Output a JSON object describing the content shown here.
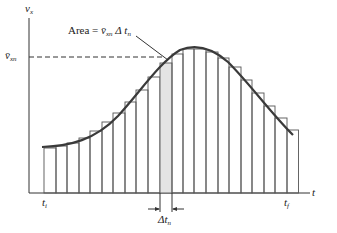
{
  "diagram": {
    "y_axis_label": "v",
    "y_axis_label_sub": "x",
    "x_axis_label": "t",
    "avg_velocity_label": "v̄",
    "avg_velocity_label_sub": "xn",
    "area_label_prefix": "Area = ",
    "area_label_v": "v̄",
    "area_label_v_sub": "xn",
    "area_label_dt": " Δ t",
    "area_label_dt_sub": "n",
    "t_initial": "t",
    "t_initial_sub": "i",
    "t_final": "t",
    "t_final_sub": "f",
    "delta_t": "Δt",
    "delta_t_sub": "n",
    "colors": {
      "line": "#3a3a3a",
      "shaded": "#e4e4e4",
      "background": "#ffffff"
    },
    "baseline_y": 193,
    "bars": [
      {
        "x": 44,
        "top": 148
      },
      {
        "x": 56,
        "top": 146
      },
      {
        "x": 67,
        "top": 143
      },
      {
        "x": 79,
        "top": 138
      },
      {
        "x": 90,
        "top": 131
      },
      {
        "x": 102,
        "top": 122
      },
      {
        "x": 113,
        "top": 113
      },
      {
        "x": 125,
        "top": 102
      },
      {
        "x": 136,
        "top": 90
      },
      {
        "x": 148,
        "top": 77
      },
      {
        "x": 160,
        "top": 63,
        "shaded": true
      },
      {
        "x": 172,
        "top": 54
      },
      {
        "x": 183,
        "top": 49
      },
      {
        "x": 194,
        "top": 49
      },
      {
        "x": 206,
        "top": 52
      },
      {
        "x": 218,
        "top": 58
      },
      {
        "x": 229,
        "top": 67
      },
      {
        "x": 241,
        "top": 80
      },
      {
        "x": 252,
        "top": 93
      },
      {
        "x": 264,
        "top": 106
      },
      {
        "x": 275,
        "top": 118
      },
      {
        "x": 287,
        "top": 130
      }
    ]
  }
}
